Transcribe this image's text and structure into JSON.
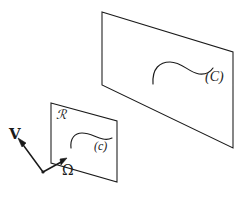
{
  "figure": {
    "type": "geometric-diagram",
    "background_color": "#ffffff",
    "stroke_color": "#1a1a1a",
    "planes": [
      {
        "id": "large-plane",
        "label": "(C)",
        "curve_name": "C",
        "corners": [
          [
            102,
            12
          ],
          [
            233,
            52
          ],
          [
            233,
            148
          ],
          [
            102,
            85
          ]
        ]
      },
      {
        "id": "small-plane",
        "label": "R",
        "plane_label": "ℛ",
        "curve_name": "c",
        "curve_label": "(c)",
        "corners": [
          [
            51,
            103
          ],
          [
            117,
            121
          ],
          [
            117,
            182
          ],
          [
            51,
            163
          ]
        ]
      }
    ],
    "labels": {
      "region_r": "ℛ",
      "curve_small": "(c)",
      "curve_large": "(C)",
      "vector_v": "V",
      "vector_omega": "Ω"
    },
    "vectors": [
      {
        "name": "V",
        "label": "V",
        "origin": [
          43,
          172
        ],
        "tip": [
          19,
          140
        ]
      },
      {
        "name": "Omega",
        "label": "Ω",
        "origin": [
          43,
          172
        ],
        "tip": [
          66,
          159
        ]
      }
    ]
  }
}
